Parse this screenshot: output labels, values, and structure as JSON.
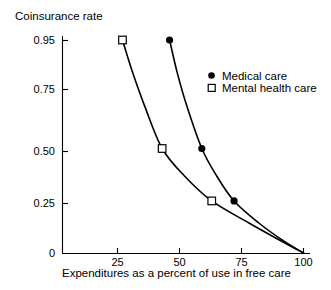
{
  "chart_data": {
    "type": "line",
    "title": "",
    "subtitle": "",
    "xlabel": "Expenditures as a percent of use in free care",
    "ylabel": "Coinsurance rate",
    "xlim": [
      2.8,
      100
    ],
    "ylim": [
      0,
      0.95
    ],
    "grid": false,
    "legend_position": "upper right",
    "xticks": [
      {
        "value": 25,
        "label": "25"
      },
      {
        "value": 50,
        "label": "50"
      },
      {
        "value": 75,
        "label": "75"
      },
      {
        "value": 100,
        "label": "100"
      }
    ],
    "yticks": [
      {
        "value": 0.95,
        "label": "0.95",
        "pixel_y": 40
      },
      {
        "value": 0.75,
        "label": "0.75",
        "pixel_y": 89
      },
      {
        "value": 0.5,
        "label": "0.50",
        "pixel_y": 151
      },
      {
        "value": 0.25,
        "label": "0.25",
        "pixel_y": 203
      },
      {
        "value": 0,
        "label": "0",
        "pixel_y": 253
      }
    ],
    "series": [
      {
        "name": "Medical care",
        "marker": "filled-circle",
        "color": "#000000",
        "points": [
          {
            "x": 46,
            "y": 0.95
          },
          {
            "x": 59,
            "y": 0.51
          },
          {
            "x": 72,
            "y": 0.26
          },
          {
            "x": 100,
            "y": 0
          }
        ],
        "curve": [
          {
            "x": 46,
            "y": 0.95
          },
          {
            "x": 49,
            "y": 0.82
          },
          {
            "x": 53,
            "y": 0.68
          },
          {
            "x": 59,
            "y": 0.51
          },
          {
            "x": 65,
            "y": 0.38
          },
          {
            "x": 72,
            "y": 0.26
          },
          {
            "x": 82,
            "y": 0.15
          },
          {
            "x": 92,
            "y": 0.06
          },
          {
            "x": 100,
            "y": 0
          }
        ]
      },
      {
        "name": "Mental health care",
        "marker": "open-square",
        "color": "#000000",
        "points": [
          {
            "x": 27,
            "y": 0.95
          },
          {
            "x": 43,
            "y": 0.51
          },
          {
            "x": 63,
            "y": 0.26
          },
          {
            "x": 100,
            "y": 0
          }
        ],
        "curve": [
          {
            "x": 27,
            "y": 0.95
          },
          {
            "x": 31,
            "y": 0.82
          },
          {
            "x": 36,
            "y": 0.68
          },
          {
            "x": 43,
            "y": 0.51
          },
          {
            "x": 52,
            "y": 0.38
          },
          {
            "x": 63,
            "y": 0.26
          },
          {
            "x": 78,
            "y": 0.15
          },
          {
            "x": 91,
            "y": 0.06
          },
          {
            "x": 100,
            "y": 0
          }
        ]
      }
    ],
    "legend": [
      {
        "label": "Medical care",
        "marker": "filled-circle"
      },
      {
        "label": "Mental health care",
        "marker": "open-square"
      }
    ]
  }
}
